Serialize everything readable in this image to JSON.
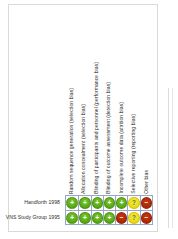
{
  "figure": {
    "type": "risk-of-bias-summary",
    "columns": [
      "Random sequence generation (selection bias)",
      "Allocation concealment (selection bias)",
      "Blinding of participants and personnel (performance bias)",
      "Blinding of outcome assessment (detection bias)",
      "Incomplete outcome data (attrition bias)",
      "Selective reporting (reporting bias)",
      "Other bias"
    ],
    "rows": [
      {
        "study": "Handforth 1998",
        "judgements": [
          "low",
          "low",
          "low",
          "low",
          "low",
          "unclear",
          "high"
        ]
      },
      {
        "study": "VNS Study Group 1995",
        "judgements": [
          "low",
          "low",
          "low",
          "low",
          "high",
          "unclear",
          "high"
        ]
      }
    ],
    "glyphs": {
      "low": "+",
      "unclear": "?",
      "high": "−"
    },
    "colors": {
      "low": "#5aab18",
      "unclear": "#e8dc1e",
      "high": "#ac2a06",
      "grid": "#9aa7c4",
      "text": "#2b2b2b",
      "panel_border": "#d9d9d9"
    }
  }
}
